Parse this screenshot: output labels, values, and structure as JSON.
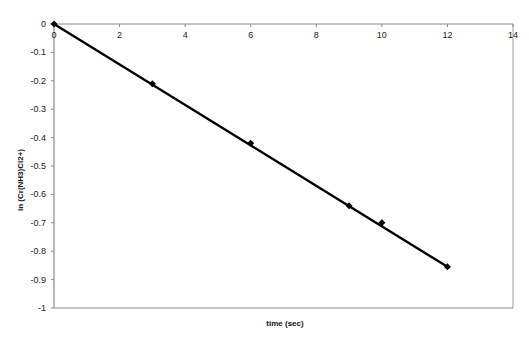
{
  "chart_data": {
    "type": "scatter",
    "title": "",
    "xlabel": "time  (sec)",
    "ylabel": "ln  (Cr(NH3)Cl2+)",
    "xlim": [
      0,
      14
    ],
    "ylim": [
      -1,
      0
    ],
    "x_ticks": [
      0,
      2,
      4,
      6,
      8,
      10,
      12,
      14
    ],
    "y_ticks": [
      0,
      -0.1,
      -0.2,
      -0.3,
      -0.4,
      -0.5,
      -0.6,
      -0.7,
      -0.8,
      -0.9,
      -1
    ],
    "x_tick_labels": [
      "0",
      "2",
      "4",
      "6",
      "8",
      "10",
      "12",
      "14"
    ],
    "y_tick_labels": [
      "0",
      "-0.1",
      "-0.2",
      "-0.3",
      "-0.4",
      "-0.5",
      "-0.6",
      "-0.7",
      "-0.8",
      "-0.9",
      "-1"
    ],
    "grid": false,
    "legend": null,
    "x_axis_position": "top",
    "series": [
      {
        "name": "ln concentration",
        "x": [
          0,
          3,
          6,
          9,
          10,
          12
        ],
        "y": [
          0,
          -0.21,
          -0.42,
          -0.64,
          -0.7,
          -0.855
        ],
        "marker": "diamond",
        "color": "#000000"
      }
    ],
    "trendline": {
      "type": "linear",
      "x": [
        0,
        12
      ],
      "y": [
        0,
        -0.855
      ],
      "color": "#000000"
    }
  }
}
